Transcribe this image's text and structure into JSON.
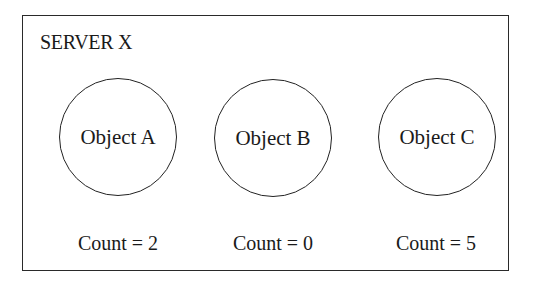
{
  "server": {
    "title": "SERVER X"
  },
  "objects": [
    {
      "label": "Object A",
      "count_text": "Count = 2",
      "count": 2
    },
    {
      "label": "Object B",
      "count_text": "Count = 0",
      "count": 0
    },
    {
      "label": "Object C",
      "count_text": "Count = 5",
      "count": 5
    }
  ]
}
